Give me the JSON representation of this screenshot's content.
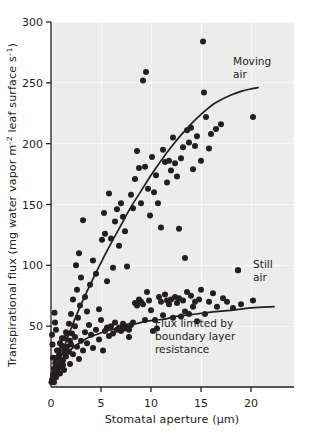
{
  "figure": {
    "background": "#ffffff",
    "plot_background": "#ececec",
    "grid_color": "#f7f7f7",
    "ink_color": "#231f20"
  },
  "axes": {
    "x_title_main": "Stomatal aperture (",
    "x_title_unit": "µm",
    "x_title_close": ")",
    "y_title_part1": "Transpirational flux (mg water vapor  m",
    "y_title_sup1": "–2",
    "y_title_part2": " leaf surface  s",
    "y_title_sup2": "–1",
    "y_title_part3": ")"
  },
  "annotations": {
    "moving_air_line1": "Moving",
    "moving_air_line2": "air",
    "still_air_line1": "Still",
    "still_air_line2": "air",
    "boundary_line1": "Flux limited by",
    "boundary_line2": "boundary layer",
    "boundary_line3": "resistance"
  },
  "chart_data": {
    "type": "scatter",
    "title": "",
    "xlabel": "Stomatal aperture (µm)",
    "ylabel": "Transpirational flux (mg water vapor m–2 leaf surface s–1)",
    "xlim": [
      0,
      24.3
    ],
    "ylim": [
      0,
      300
    ],
    "xticks": [
      0,
      5,
      10,
      15,
      20
    ],
    "xtick_labels": [
      "0",
      "5",
      "10",
      "15",
      "20"
    ],
    "yticks": [
      0,
      50,
      100,
      150,
      200,
      250,
      300
    ],
    "ytick_labels": [
      "0",
      "50",
      "100",
      "150",
      "200",
      "250",
      "300"
    ],
    "grid": true,
    "grid_axis": "both",
    "legend": "annotations-inline",
    "marker": {
      "shape": "circle",
      "size_px": 3.0,
      "color": "#231f20"
    },
    "series": [
      {
        "name": "Moving air",
        "label_position": {
          "x": 18.6,
          "y": 253
        },
        "curve": {
          "kind": "fitted-line",
          "description": "steeply rising, slightly saturating response of flux to stomatal aperture in moving air",
          "points": [
            [
              0.15,
              5
            ],
            [
              0.6,
              16
            ],
            [
              1.2,
              30
            ],
            [
              2.0,
              48
            ],
            [
              2.8,
              64
            ],
            [
              3.8,
              82
            ],
            [
              4.8,
              99
            ],
            [
              6.0,
              118
            ],
            [
              7.0,
              133
            ],
            [
              8.0,
              148
            ],
            [
              9.0,
              161
            ],
            [
              10.0,
              174
            ],
            [
              11.0,
              186
            ],
            [
              12.0,
              197
            ],
            [
              13.0,
              207
            ],
            [
              14.0,
              216
            ],
            [
              15.0,
              224
            ],
            [
              16.0,
              231
            ],
            [
              17.0,
              236
            ],
            [
              18.0,
              240
            ],
            [
              19.0,
              243
            ],
            [
              20.0,
              245
            ],
            [
              20.7,
              246
            ]
          ]
        },
        "points": [
          [
            0.1,
            6
          ],
          [
            0.2,
            10
          ],
          [
            0.3,
            4
          ],
          [
            0.35,
            13
          ],
          [
            0.45,
            19
          ],
          [
            0.5,
            8
          ],
          [
            0.6,
            24
          ],
          [
            0.7,
            15
          ],
          [
            0.8,
            30
          ],
          [
            0.9,
            11
          ],
          [
            1.0,
            22
          ],
          [
            1.1,
            34
          ],
          [
            1.2,
            18
          ],
          [
            1.3,
            40
          ],
          [
            1.4,
            27
          ],
          [
            1.5,
            45
          ],
          [
            1.6,
            33
          ],
          [
            1.8,
            52
          ],
          [
            1.9,
            38
          ],
          [
            2.0,
            60
          ],
          [
            2.1,
            44
          ],
          [
            2.2,
            72
          ],
          [
            2.4,
            50
          ],
          [
            2.5,
            100
          ],
          [
            2.6,
            80
          ],
          [
            2.7,
            57
          ],
          [
            2.8,
            110
          ],
          [
            2.9,
            67
          ],
          [
            3.0,
            90
          ],
          [
            3.2,
            137
          ],
          [
            3.4,
            74
          ],
          [
            3.6,
            62
          ],
          [
            3.9,
            84
          ],
          [
            4.2,
            104
          ],
          [
            4.5,
            93
          ],
          [
            4.8,
            64
          ],
          [
            5.1,
            121
          ],
          [
            5.3,
            143
          ],
          [
            5.4,
            126
          ],
          [
            5.6,
            87
          ],
          [
            5.8,
            159
          ],
          [
            6.0,
            122
          ],
          [
            6.2,
            98
          ],
          [
            6.4,
            136
          ],
          [
            6.6,
            146
          ],
          [
            6.8,
            116
          ],
          [
            7.0,
            151
          ],
          [
            7.2,
            140
          ],
          [
            7.4,
            128
          ],
          [
            7.6,
            99
          ],
          [
            7.8,
            41
          ],
          [
            8.0,
            158
          ],
          [
            8.2,
            147
          ],
          [
            8.4,
            171
          ],
          [
            8.6,
            194
          ],
          [
            8.8,
            180
          ],
          [
            9.0,
            151
          ],
          [
            9.2,
            252
          ],
          [
            9.4,
            181
          ],
          [
            9.5,
            259
          ],
          [
            9.7,
            163
          ],
          [
            9.9,
            141
          ],
          [
            10.1,
            189
          ],
          [
            10.3,
            160
          ],
          [
            10.5,
            174
          ],
          [
            10.7,
            151
          ],
          [
            11.0,
            131
          ],
          [
            11.2,
            195
          ],
          [
            11.4,
            185
          ],
          [
            11.6,
            168
          ],
          [
            11.8,
            186
          ],
          [
            12.0,
            178
          ],
          [
            12.2,
            205
          ],
          [
            12.4,
            184
          ],
          [
            12.6,
            173
          ],
          [
            12.8,
            130
          ],
          [
            13.0,
            188
          ],
          [
            13.2,
            197
          ],
          [
            13.4,
            106
          ],
          [
            13.6,
            211
          ],
          [
            13.8,
            201
          ],
          [
            14.0,
            213
          ],
          [
            14.2,
            179
          ],
          [
            14.4,
            198
          ],
          [
            14.6,
            206
          ],
          [
            15.0,
            186
          ],
          [
            15.2,
            284
          ],
          [
            15.3,
            242
          ],
          [
            15.5,
            222
          ],
          [
            15.8,
            196
          ],
          [
            16.0,
            208
          ],
          [
            16.5,
            212
          ],
          [
            17.0,
            216
          ],
          [
            18.7,
            96
          ],
          [
            20.2,
            222
          ]
        ]
      },
      {
        "name": "Still air",
        "label_position": {
          "x": 21.0,
          "y": 86
        },
        "curve": {
          "kind": "fitted-line",
          "description": "saturating curve limited by boundary layer resistance",
          "points": [
            [
              0.1,
              4
            ],
            [
              0.4,
              12
            ],
            [
              0.8,
              19
            ],
            [
              1.3,
              25
            ],
            [
              2.0,
              31
            ],
            [
              2.8,
              36
            ],
            [
              3.6,
              40
            ],
            [
              4.5,
              43
            ],
            [
              5.5,
              46
            ],
            [
              6.5,
              48
            ],
            [
              7.5,
              50
            ],
            [
              8.5,
              52
            ],
            [
              9.5,
              54
            ],
            [
              10.5,
              55
            ],
            [
              11.5,
              56
            ],
            [
              12.5,
              58
            ],
            [
              13.5,
              59
            ],
            [
              14.5,
              60
            ],
            [
              15.5,
              61
            ],
            [
              16.5,
              62
            ],
            [
              18.0,
              63
            ],
            [
              20.0,
              65
            ],
            [
              22.3,
              66
            ]
          ]
        },
        "points": [
          [
            0.05,
            4
          ],
          [
            0.1,
            43
          ],
          [
            0.15,
            35
          ],
          [
            0.2,
            24
          ],
          [
            0.25,
            9
          ],
          [
            0.3,
            15
          ],
          [
            0.35,
            61
          ],
          [
            0.4,
            53
          ],
          [
            0.45,
            20
          ],
          [
            0.5,
            47
          ],
          [
            0.6,
            30
          ],
          [
            0.7,
            11
          ],
          [
            0.8,
            26
          ],
          [
            0.9,
            36
          ],
          [
            1.0,
            17
          ],
          [
            1.1,
            40
          ],
          [
            1.2,
            22
          ],
          [
            1.3,
            14
          ],
          [
            1.4,
            31
          ],
          [
            1.5,
            25
          ],
          [
            1.6,
            44
          ],
          [
            1.8,
            29
          ],
          [
            1.9,
            19
          ],
          [
            2.0,
            35
          ],
          [
            2.2,
            27
          ],
          [
            2.4,
            41
          ],
          [
            2.6,
            33
          ],
          [
            2.8,
            23
          ],
          [
            3.0,
            38
          ],
          [
            3.2,
            30
          ],
          [
            3.4,
            45
          ],
          [
            3.6,
            36
          ],
          [
            3.8,
            51
          ],
          [
            4.0,
            43
          ],
          [
            4.2,
            32
          ],
          [
            4.5,
            47
          ],
          [
            4.8,
            39
          ],
          [
            5.0,
            55
          ],
          [
            5.2,
            30
          ],
          [
            5.4,
            46
          ],
          [
            5.6,
            49
          ],
          [
            5.8,
            42
          ],
          [
            6.0,
            50
          ],
          [
            6.2,
            44
          ],
          [
            6.4,
            53
          ],
          [
            6.6,
            47
          ],
          [
            6.8,
            49
          ],
          [
            7.0,
            46
          ],
          [
            7.2,
            52
          ],
          [
            7.4,
            48
          ],
          [
            7.6,
            50
          ],
          [
            7.8,
            47
          ],
          [
            8.0,
            51
          ],
          [
            8.2,
            53
          ],
          [
            8.4,
            69
          ],
          [
            8.6,
            67
          ],
          [
            8.8,
            72
          ],
          [
            9.0,
            70
          ],
          [
            9.2,
            68
          ],
          [
            9.4,
            55
          ],
          [
            9.6,
            78
          ],
          [
            9.8,
            71
          ],
          [
            10.0,
            63
          ],
          [
            10.2,
            46
          ],
          [
            10.4,
            55
          ],
          [
            10.6,
            48
          ],
          [
            10.8,
            74
          ],
          [
            11.0,
            70
          ],
          [
            11.2,
            59
          ],
          [
            11.4,
            76
          ],
          [
            11.6,
            71
          ],
          [
            11.8,
            68
          ],
          [
            12.0,
            72
          ],
          [
            12.2,
            57
          ],
          [
            12.4,
            74
          ],
          [
            12.6,
            69
          ],
          [
            12.8,
            73
          ],
          [
            13.0,
            58
          ],
          [
            13.2,
            71
          ],
          [
            13.4,
            62
          ],
          [
            13.6,
            78
          ],
          [
            13.8,
            60
          ],
          [
            14.0,
            75
          ],
          [
            14.2,
            66
          ],
          [
            14.4,
            70
          ],
          [
            14.6,
            54
          ],
          [
            14.8,
            72
          ],
          [
            15.0,
            80
          ],
          [
            15.4,
            60
          ],
          [
            15.8,
            70
          ],
          [
            16.2,
            77
          ],
          [
            16.6,
            66
          ],
          [
            17.2,
            73
          ],
          [
            17.6,
            70
          ],
          [
            18.2,
            65
          ],
          [
            18.7,
            96
          ],
          [
            19.0,
            68
          ],
          [
            20.2,
            71
          ]
        ]
      }
    ]
  }
}
